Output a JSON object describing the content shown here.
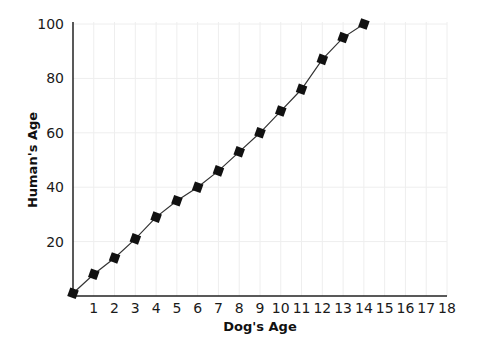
{
  "chart_data": {
    "type": "line",
    "title": "",
    "xlabel": "Dog's Age",
    "ylabel": "Human's Age",
    "xlim": [
      0,
      18
    ],
    "ylim": [
      0,
      100
    ],
    "x_ticks": [
      1,
      2,
      3,
      4,
      5,
      6,
      7,
      8,
      9,
      10,
      11,
      12,
      13,
      14,
      15,
      16,
      17,
      18
    ],
    "y_ticks": [
      20,
      40,
      60,
      80,
      100
    ],
    "grid": true,
    "legend": null,
    "marker": "diamond-square",
    "series": [
      {
        "name": "Human's Age",
        "x": [
          0,
          1,
          2,
          3,
          4,
          5,
          6,
          7,
          8,
          9,
          10,
          11,
          12,
          13,
          14
        ],
        "values": [
          1,
          8,
          14,
          21,
          29,
          35,
          40,
          46,
          53,
          60,
          68,
          76,
          87,
          95,
          100
        ]
      }
    ]
  },
  "colors": {
    "line": "#333333",
    "marker": "#111111",
    "axis": "#222222",
    "grid": "#eeeeee"
  }
}
